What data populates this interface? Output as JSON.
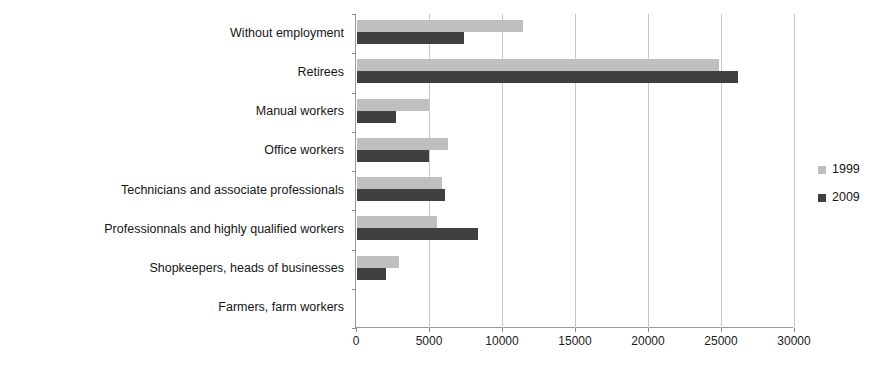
{
  "chart_data": {
    "type": "bar",
    "orientation": "horizontal",
    "title": "",
    "xlabel": "",
    "ylabel": "",
    "xlim": [
      0,
      30000
    ],
    "xticks": [
      "0",
      "5000",
      "10000",
      "15000",
      "20000",
      "25000",
      "30000"
    ],
    "grid": true,
    "legend_position": "right",
    "categories": [
      "Without employment",
      "Retirees",
      "Manual workers",
      "Office workers",
      "Technicians and associate professionals",
      "Professionnals and highly qualified workers",
      "Shopkeepers, heads of businesses",
      "Farmers, farm workers"
    ],
    "series": [
      {
        "name": "1999",
        "color": "#bfbfbf",
        "values": [
          11400,
          24800,
          4900,
          6250,
          5800,
          5450,
          2900,
          0
        ]
      },
      {
        "name": "2009",
        "color": "#404040",
        "values": [
          7350,
          26100,
          2650,
          4950,
          6000,
          8300,
          2000,
          0
        ]
      }
    ]
  },
  "legend": {
    "items": [
      {
        "label": "1999",
        "color": "#bfbfbf"
      },
      {
        "label": "2009",
        "color": "#404040"
      }
    ]
  },
  "axis": {
    "x_tick_labels": [
      "0",
      "5000",
      "10000",
      "15000",
      "20000",
      "25000",
      "30000"
    ],
    "x_max": 30000,
    "x_min": 0
  }
}
